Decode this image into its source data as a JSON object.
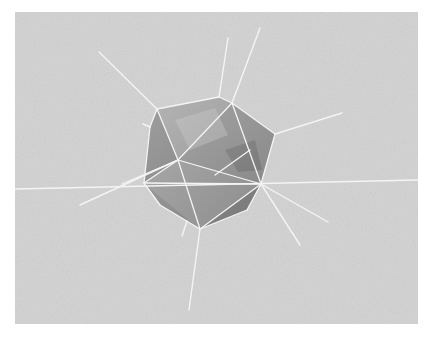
{
  "image": {
    "width": 430,
    "height": 337,
    "page_background": "#ffffff",
    "panel": {
      "x": 15,
      "y": 12,
      "width": 403,
      "height": 312,
      "color": "#d2d2d2",
      "noise_color": "#c4c4c4"
    },
    "line_color": "#f4f4f4",
    "polyhedron": {
      "outline": [
        [
          157,
          109
        ],
        [
          219,
          97
        ],
        [
          232,
          103
        ],
        [
          275,
          134
        ],
        [
          261,
          184
        ],
        [
          247,
          210
        ],
        [
          200,
          229
        ],
        [
          160,
          205
        ],
        [
          144,
          183
        ],
        [
          150,
          127
        ]
      ],
      "faces": [
        {
          "points": [
            [
              157,
              109
            ],
            [
              219,
              97
            ],
            [
              232,
              103
            ],
            [
              178,
              160
            ]
          ],
          "fill": "#a8a8a8"
        },
        {
          "points": [
            [
              232,
              103
            ],
            [
              275,
              134
            ],
            [
              261,
              184
            ],
            [
              178,
              160
            ]
          ],
          "fill": "#9a9a9a"
        },
        {
          "points": [
            [
              157,
              109
            ],
            [
              178,
              160
            ],
            [
              144,
              183
            ],
            [
              150,
              127
            ]
          ],
          "fill": "#8e8e8e"
        },
        {
          "points": [
            [
              178,
              160
            ],
            [
              261,
              184
            ],
            [
              200,
              229
            ],
            [
              144,
              183
            ]
          ],
          "fill": "#a2a2a2"
        },
        {
          "points": [
            [
              261,
              184
            ],
            [
              247,
              210
            ],
            [
              200,
              229
            ]
          ],
          "fill": "#8a8a8a"
        },
        {
          "points": [
            [
              144,
              183
            ],
            [
              200,
              229
            ],
            [
              160,
              205
            ]
          ],
          "fill": "#949494"
        }
      ],
      "highlights": [
        {
          "points": [
            [
              175,
              120
            ],
            [
              215,
              108
            ],
            [
              228,
              135
            ],
            [
              190,
              150
            ]
          ],
          "fill": "#c2c2c2",
          "opacity": 0.55
        },
        {
          "points": [
            [
              225,
              150
            ],
            [
              255,
              140
            ],
            [
              262,
              170
            ],
            [
              238,
              172
            ]
          ],
          "fill": "#6f6f6f",
          "opacity": 0.45
        }
      ]
    },
    "edges": [
      [
        [
          157,
          109
        ],
        [
          219,
          97
        ]
      ],
      [
        [
          219,
          97
        ],
        [
          232,
          103
        ]
      ],
      [
        [
          232,
          103
        ],
        [
          275,
          134
        ]
      ],
      [
        [
          275,
          134
        ],
        [
          261,
          184
        ]
      ],
      [
        [
          261,
          184
        ],
        [
          247,
          210
        ]
      ],
      [
        [
          247,
          210
        ],
        [
          200,
          229
        ]
      ],
      [
        [
          200,
          229
        ],
        [
          160,
          205
        ]
      ],
      [
        [
          160,
          205
        ],
        [
          144,
          183
        ]
      ],
      [
        [
          144,
          183
        ],
        [
          150,
          127
        ]
      ],
      [
        [
          150,
          127
        ],
        [
          157,
          109
        ]
      ],
      [
        [
          157,
          109
        ],
        [
          178,
          160
        ]
      ],
      [
        [
          232,
          103
        ],
        [
          178,
          160
        ]
      ],
      [
        [
          232,
          103
        ],
        [
          261,
          184
        ]
      ],
      [
        [
          178,
          160
        ],
        [
          261,
          184
        ]
      ],
      [
        [
          178,
          160
        ],
        [
          200,
          229
        ]
      ],
      [
        [
          144,
          183
        ],
        [
          178,
          160
        ]
      ],
      [
        [
          261,
          184
        ],
        [
          200,
          229
        ]
      ],
      [
        [
          144,
          183
        ],
        [
          261,
          184
        ]
      ],
      [
        [
          178,
          160
        ],
        [
          122,
          184
        ]
      ],
      [
        [
          250,
          150
        ],
        [
          215,
          175
        ]
      ]
    ],
    "spokes": [
      [
        [
          15,
          189
        ],
        [
          418,
          180
        ]
      ],
      [
        [
          157,
          109
        ],
        [
          99,
          52
        ]
      ],
      [
        [
          219,
          97
        ],
        [
          228,
          38
        ]
      ],
      [
        [
          232,
          103
        ],
        [
          260,
          28
        ]
      ],
      [
        [
          275,
          134
        ],
        [
          342,
          113
        ]
      ],
      [
        [
          261,
          184
        ],
        [
          328,
          222
        ]
      ],
      [
        [
          261,
          184
        ],
        [
          300,
          245
        ]
      ],
      [
        [
          200,
          229
        ],
        [
          189,
          310
        ]
      ],
      [
        [
          187,
          221
        ],
        [
          182,
          236
        ]
      ],
      [
        [
          150,
          127
        ],
        [
          143,
          124
        ]
      ],
      [
        [
          178,
          160
        ],
        [
          80,
          205
        ]
      ]
    ]
  }
}
